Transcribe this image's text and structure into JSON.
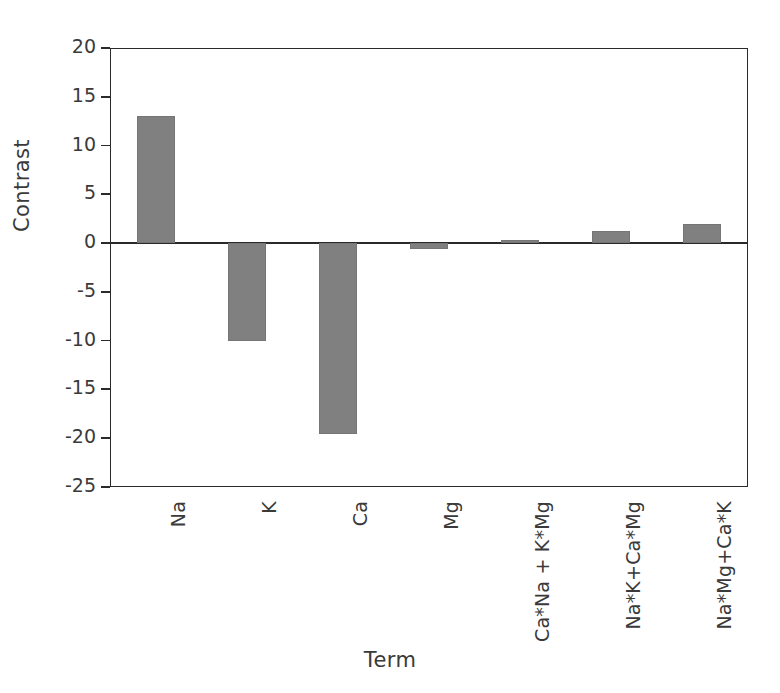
{
  "chart_data": {
    "type": "bar",
    "title": "",
    "xlabel": "Term",
    "ylabel": "Contrast",
    "categories": [
      "Na",
      "K",
      "Ca",
      "Mg",
      "Ca*Na + K*Mg",
      "Na*K+Ca*Mg",
      "Na*Mg+Ca*K"
    ],
    "values": [
      13.0,
      -10.0,
      -19.6,
      -0.6,
      0.3,
      1.2,
      2.0
    ],
    "ylim": [
      -25,
      20
    ],
    "yticks": [
      20,
      15,
      10,
      5,
      0,
      -5,
      -10,
      -15,
      -20,
      -25
    ],
    "ytick_labels": [
      "20",
      "15",
      "10",
      "5",
      "0",
      "-5",
      "-10",
      "-15",
      "-20",
      "-25"
    ],
    "grid": false,
    "legend": false,
    "bar_color": "#808080",
    "axis_color": "#2a2a2a",
    "background_color": "#ffffff"
  }
}
